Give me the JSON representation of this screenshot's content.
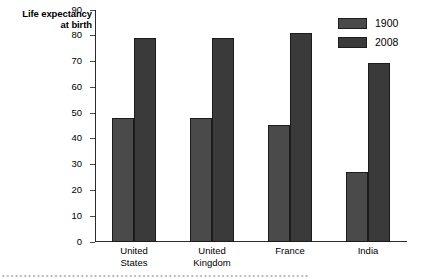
{
  "chart_data": {
    "type": "bar",
    "title": "",
    "ylabel": "Life expectancy at birth",
    "ylabel_line1": "Life expectancy",
    "ylabel_line2": "at birth",
    "xlabel": "",
    "ylim": [
      0,
      90
    ],
    "yticks": [
      0,
      10,
      20,
      30,
      40,
      50,
      60,
      70,
      80,
      90
    ],
    "ytick_labels": [
      "0",
      "10",
      "20",
      "30",
      "40",
      "50",
      "60",
      "70",
      "80",
      "90"
    ],
    "grid": false,
    "legend_position": "top-right",
    "categories": [
      "United States",
      "United Kingdom",
      "France",
      "India"
    ],
    "category_lines": [
      [
        "United",
        "States"
      ],
      [
        "United",
        "Kingdom"
      ],
      [
        "France",
        ""
      ],
      [
        "India",
        ""
      ]
    ],
    "series": [
      {
        "name": "1900",
        "color": "#4a4a4a",
        "values": [
          48,
          48,
          45.5,
          27
        ]
      },
      {
        "name": "2008",
        "color": "#3a3a3a",
        "values": [
          79,
          79,
          81,
          69.5
        ]
      }
    ]
  },
  "legend": {
    "items": [
      {
        "label": "1900",
        "color": "#4a4a4a"
      },
      {
        "label": "2008",
        "color": "#3a3a3a"
      }
    ]
  },
  "caption": {
    "clipped_text": "• • • • • • • • • • • • • • • • • • • • • • • • • • • • • • • • • • • • • • • • • • • • • • • • • • • • • • • • • • • • • • • • • • • • • •"
  },
  "colors": {
    "axis": "#2b2b2b",
    "bar_outline": "#1c1c1c",
    "background": "#ffffff",
    "text": "#000000"
  }
}
